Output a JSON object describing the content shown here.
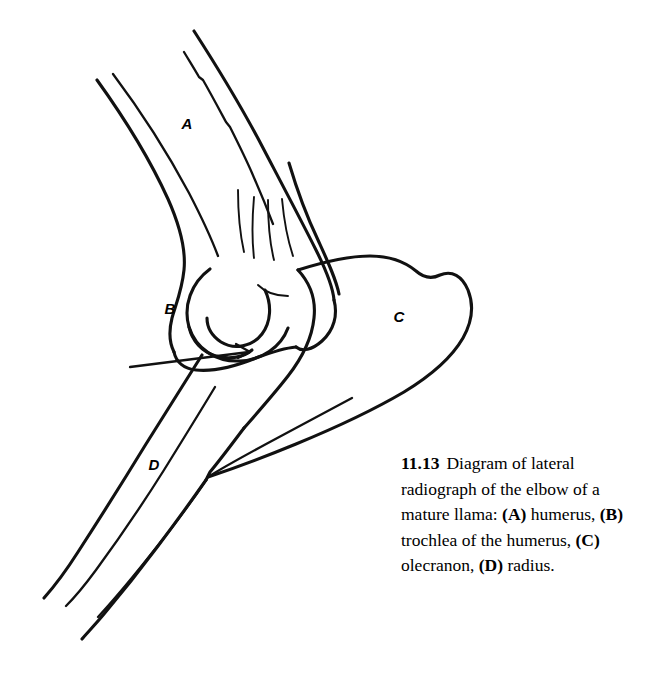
{
  "figure": {
    "number": "11.13",
    "caption_text": "Diagram of lateral radiograph of the elbow of a mature llama:",
    "caption_full": "11.13   Diagram of lateral radiograph of the elbow of a mature llama: (A) humerus, (B) trochlea of the humerus, (C) olecranon, (D) radius.",
    "background_color": "#ffffff",
    "ink_color": "#111111",
    "type": "line-drawing",
    "subject": "lateral radiograph of the elbow of a mature llama"
  },
  "legend": {
    "intro": "Diagram of lateral radiograph of the elbow of a mature llama:",
    "entries": [
      {
        "key": "(A)",
        "term": "humerus",
        "separator": ","
      },
      {
        "key": "(B)",
        "term": "trochlea of the humerus",
        "separator": ","
      },
      {
        "key": "(C)",
        "term": "olecranon",
        "separator": ","
      },
      {
        "key": "(D)",
        "term": "radius",
        "separator": "."
      }
    ]
  },
  "diagram_labels": [
    {
      "id": "A",
      "text": "A",
      "term": "humerus",
      "x": 187,
      "y": 129
    },
    {
      "id": "B",
      "text": "B",
      "term": "trochlea of the humerus",
      "x": 170,
      "y": 314
    },
    {
      "id": "C",
      "text": "C",
      "term": "olecranon",
      "x": 399,
      "y": 322
    },
    {
      "id": "D",
      "text": "D",
      "term": "radius",
      "x": 154,
      "y": 470
    }
  ]
}
